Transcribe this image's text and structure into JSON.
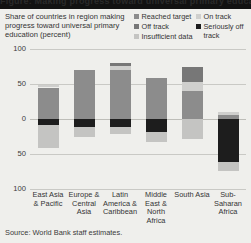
{
  "header": {
    "headline": "Figure: Making progress toward universal primary education"
  },
  "subtitle": "Share of countries in region making progress toward universal primary education (percent)",
  "legend": {
    "position": "top-right",
    "left_column": [
      {
        "label": "Reached target",
        "swatch": "legend-swatch-reached-target",
        "color": "#8c8c8c"
      },
      {
        "label": "Off track",
        "swatch": "legend-swatch-off-track",
        "color": "#777777"
      },
      {
        "label": "Insufficient data",
        "swatch": "legend-swatch-insufficient-data",
        "color": "#c4c4c2"
      }
    ],
    "right_column": [
      {
        "label": "On track",
        "swatch": "legend-swatch-on-track",
        "color": "#cfcfcd"
      },
      {
        "label": "Seriously off track",
        "swatch": "legend-swatch-seriously-off-track",
        "color": "#1d1d1d"
      }
    ]
  },
  "source": "Source: World Bank staff estimates.",
  "chart_data": {
    "type": "bar",
    "title": "Share of countries in region making progress toward universal primary education (percent)",
    "xlabel": "",
    "ylabel": "percent",
    "stacked": true,
    "diverging": true,
    "grid": true,
    "ylim": [
      -100,
      100
    ],
    "yticks": [
      100,
      50,
      0,
      50,
      100
    ],
    "ytick_labels": [
      "100",
      "50",
      "0",
      "50",
      "100"
    ],
    "categories": [
      "East Asia & Pacific",
      "Europe & Central Asia",
      "Latin America & Caribbean",
      "Middle East & North Africa",
      "South Asia",
      "Sub-Saharan Africa"
    ],
    "series": [
      {
        "name": "Reached target",
        "color": "#8c8c8c",
        "direction": "up",
        "values": [
          45,
          70,
          70,
          58,
          40,
          6
        ]
      },
      {
        "name": "On track",
        "color": "#cfcfcd",
        "direction": "up",
        "values": [
          4,
          0,
          6,
          0,
          13,
          4
        ]
      },
      {
        "name": "Off track",
        "color": "#777777",
        "direction": "up",
        "values": [
          0,
          0,
          4,
          0,
          22,
          0
        ]
      },
      {
        "name": "Seriously off track",
        "color": "#1d1d1d",
        "direction": "down",
        "values": [
          9,
          11,
          11,
          18,
          0,
          62
        ]
      },
      {
        "name": "Insufficient data",
        "color": "#c4c4c2",
        "direction": "down",
        "values": [
          33,
          15,
          10,
          15,
          28,
          13
        ]
      }
    ]
  }
}
